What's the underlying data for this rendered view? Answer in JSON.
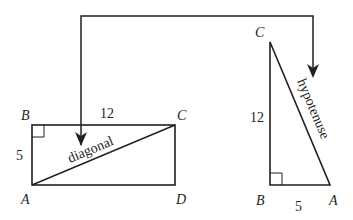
{
  "rectangle": {
    "vertices": {
      "A": "A",
      "B": "B",
      "C": "C",
      "D": "D"
    },
    "side_top": "12",
    "side_left": "5",
    "diagonal_label": "diagonal"
  },
  "triangle": {
    "vertices": {
      "A": "A",
      "B": "B",
      "C": "C"
    },
    "side_vertical": "12",
    "side_bottom": "5",
    "hypotenuse_label": "hypotenuse"
  },
  "colors": {
    "stroke": "#231f20",
    "background": "#ffffff"
  }
}
